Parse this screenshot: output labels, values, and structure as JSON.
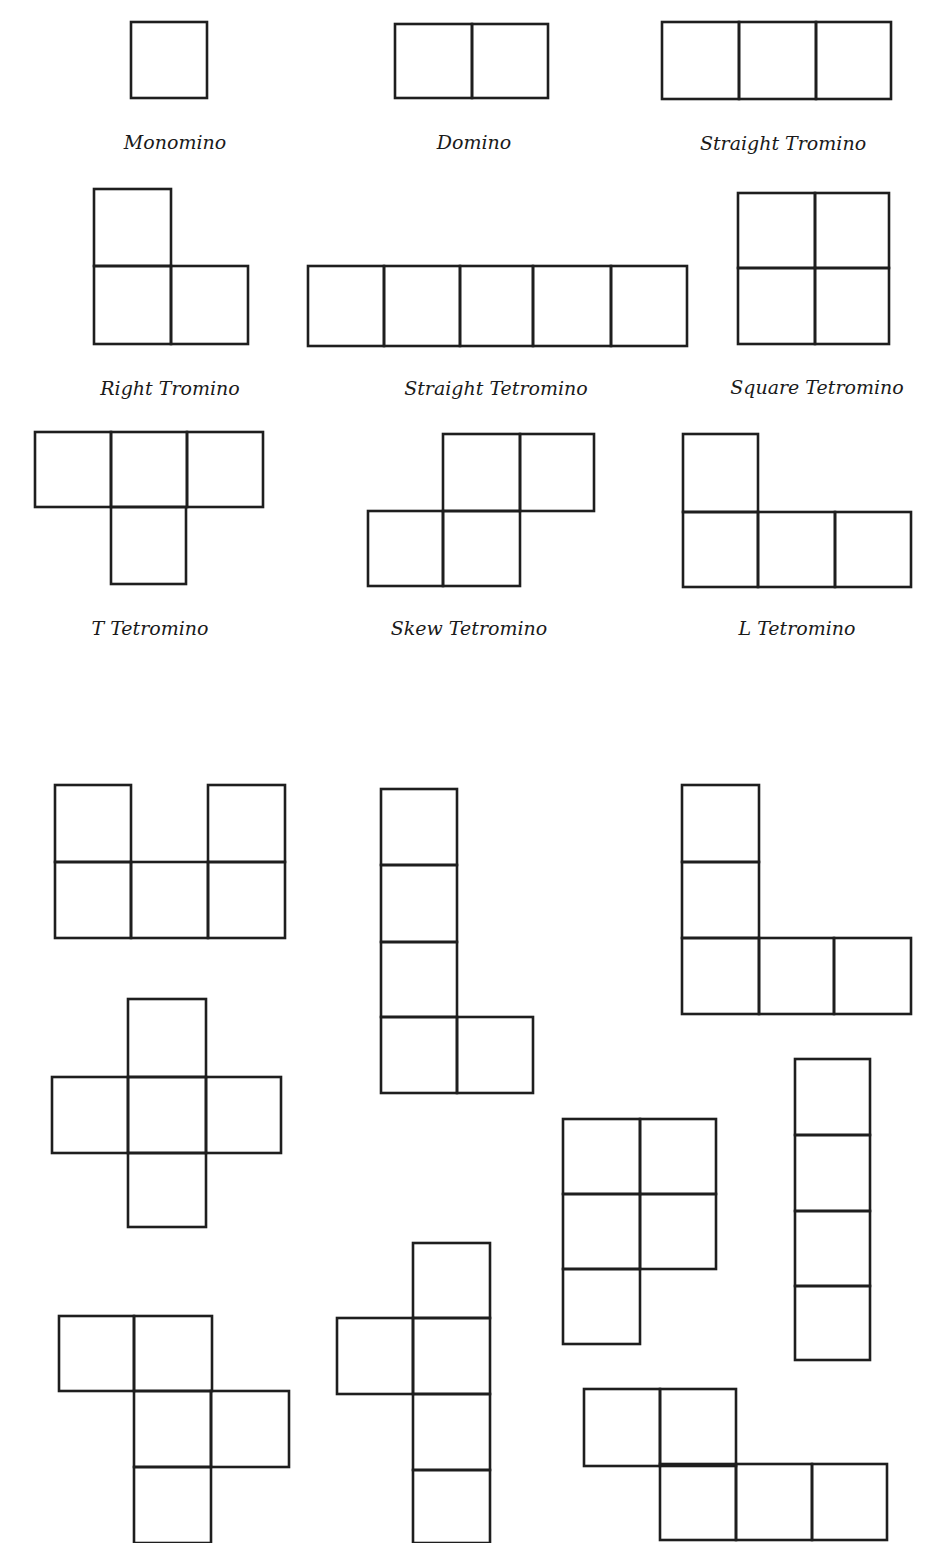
{
  "diagram": {
    "stroke_color": "#1e1e1e",
    "background": "#ffffff",
    "labeled_shapes": [
      {
        "name": "monomino",
        "label": "Monomino",
        "label_x": 175,
        "label_y": 131,
        "cells": [
          [
            131,
            22,
            76,
            76
          ]
        ]
      },
      {
        "name": "domino",
        "label": "Domino",
        "label_x": 474,
        "label_y": 131,
        "cells": [
          [
            395,
            24,
            77,
            74
          ],
          [
            472,
            24,
            76,
            74
          ]
        ]
      },
      {
        "name": "straight-tromino",
        "label": "Straight Tromino",
        "label_x": 783,
        "label_y": 132,
        "cells": [
          [
            662,
            22,
            77,
            77
          ],
          [
            739,
            22,
            77,
            77
          ],
          [
            816,
            22,
            75,
            77
          ]
        ]
      },
      {
        "name": "right-tromino",
        "label": "Right Tromino",
        "label_x": 170,
        "label_y": 377,
        "cells": [
          [
            94,
            189,
            77,
            77
          ],
          [
            94,
            266,
            77,
            78
          ],
          [
            171,
            266,
            77,
            78
          ]
        ]
      },
      {
        "name": "straight-tetromino",
        "label": "Straight Tetromino",
        "label_x": 496,
        "label_y": 377,
        "cells": [
          [
            308,
            266,
            76,
            80
          ],
          [
            384,
            266,
            76,
            80
          ],
          [
            460,
            266,
            73,
            80
          ],
          [
            533,
            266,
            78,
            80
          ],
          [
            611,
            266,
            76,
            80
          ]
        ]
      },
      {
        "name": "square-tetromino",
        "label": "Square Tetromino",
        "label_x": 817,
        "label_y": 376,
        "cells": [
          [
            738,
            193,
            77,
            75
          ],
          [
            815,
            193,
            74,
            75
          ],
          [
            738,
            268,
            77,
            76
          ],
          [
            815,
            268,
            74,
            76
          ]
        ]
      },
      {
        "name": "t-tetromino",
        "label": "T Tetromino",
        "label_x": 150,
        "label_y": 617,
        "cells": [
          [
            35,
            432,
            76,
            75
          ],
          [
            111,
            432,
            76,
            75
          ],
          [
            187,
            432,
            76,
            75
          ],
          [
            111,
            507,
            75,
            77
          ]
        ]
      },
      {
        "name": "skew-tetromino",
        "label": "Skew Tetromino",
        "label_x": 469,
        "label_y": 617,
        "cells": [
          [
            443,
            434,
            77,
            77
          ],
          [
            520,
            434,
            74,
            77
          ],
          [
            368,
            511,
            75,
            75
          ],
          [
            443,
            511,
            77,
            75
          ]
        ]
      },
      {
        "name": "l-tetromino",
        "label": "L Tetromino",
        "label_x": 797,
        "label_y": 617,
        "cells": [
          [
            683,
            434,
            75,
            78
          ],
          [
            683,
            512,
            75,
            75
          ],
          [
            758,
            512,
            77,
            75
          ],
          [
            835,
            512,
            76,
            75
          ]
        ]
      }
    ],
    "unlabeled_shapes": [
      {
        "name": "u-pentomino",
        "cells": [
          [
            55,
            785,
            76,
            77
          ],
          [
            208,
            785,
            77,
            77
          ],
          [
            55,
            862,
            76,
            76
          ],
          [
            131,
            862,
            77,
            76
          ],
          [
            208,
            862,
            77,
            76
          ]
        ]
      },
      {
        "name": "l-pentomino",
        "cells": [
          [
            381,
            789,
            76,
            76
          ],
          [
            381,
            865,
            76,
            77
          ],
          [
            381,
            942,
            76,
            75
          ],
          [
            381,
            1017,
            76,
            76
          ],
          [
            457,
            1017,
            76,
            76
          ]
        ]
      },
      {
        "name": "v-pentomino",
        "cells": [
          [
            682,
            785,
            77,
            77
          ],
          [
            682,
            862,
            77,
            76
          ],
          [
            682,
            938,
            77,
            76
          ],
          [
            759,
            938,
            75,
            76
          ],
          [
            834,
            938,
            77,
            76
          ]
        ]
      },
      {
        "name": "x-pentomino",
        "cells": [
          [
            128,
            999,
            78,
            78
          ],
          [
            52,
            1077,
            76,
            76
          ],
          [
            128,
            1077,
            78,
            76
          ],
          [
            206,
            1077,
            75,
            76
          ],
          [
            128,
            1153,
            78,
            74
          ]
        ]
      },
      {
        "name": "p-pentomino",
        "cells": [
          [
            563,
            1119,
            77,
            75
          ],
          [
            640,
            1119,
            76,
            75
          ],
          [
            563,
            1194,
            77,
            75
          ],
          [
            640,
            1194,
            76,
            75
          ],
          [
            563,
            1269,
            77,
            75
          ]
        ]
      },
      {
        "name": "i-pentomino",
        "cells": [
          [
            795,
            1059,
            75,
            76
          ],
          [
            795,
            1135,
            75,
            76
          ],
          [
            795,
            1211,
            75,
            75
          ],
          [
            795,
            1286,
            75,
            74
          ]
        ]
      },
      {
        "name": "f-pentomino",
        "cells": [
          [
            59,
            1316,
            75,
            75
          ],
          [
            134,
            1316,
            78,
            75
          ],
          [
            134,
            1391,
            77,
            76
          ],
          [
            211,
            1391,
            78,
            76
          ],
          [
            134,
            1467,
            77,
            76
          ]
        ]
      },
      {
        "name": "y-pentomino",
        "cells": [
          [
            413,
            1243,
            77,
            75
          ],
          [
            337,
            1318,
            76,
            76
          ],
          [
            413,
            1318,
            77,
            76
          ],
          [
            413,
            1394,
            77,
            76
          ],
          [
            413,
            1470,
            77,
            73
          ]
        ]
      },
      {
        "name": "n-pentomino",
        "cells": [
          [
            584,
            1389,
            76,
            77
          ],
          [
            660,
            1389,
            76,
            77
          ],
          [
            660,
            1464,
            76,
            76
          ],
          [
            736,
            1464,
            76,
            76
          ],
          [
            812,
            1464,
            75,
            76
          ]
        ]
      }
    ]
  }
}
